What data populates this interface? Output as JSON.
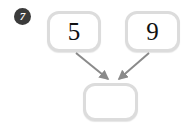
{
  "problem": {
    "number_badge": "7",
    "badge_color": "#3b3b3b",
    "badge_text_color": "#ffffff"
  },
  "diagram": {
    "type": "number-bond",
    "card_border_color": "#dcdcdc",
    "card_fill_color": "#ffffff",
    "arrow_color": "#8a8a8a",
    "nodes": [
      {
        "id": "addend-1",
        "label": "5",
        "role": "addend",
        "filled": true
      },
      {
        "id": "addend-2",
        "label": "9",
        "role": "addend",
        "filled": true
      },
      {
        "id": "sum",
        "label": "",
        "role": "sum",
        "filled": false
      }
    ],
    "edges": [
      {
        "from": "addend-1",
        "to": "sum"
      },
      {
        "from": "addend-2",
        "to": "sum"
      }
    ]
  }
}
